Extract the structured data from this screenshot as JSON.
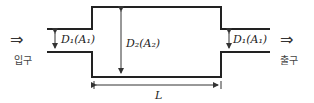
{
  "diagram": {
    "inlet_label": "입구",
    "outlet_label": "출구",
    "inlet_arrow": "⇒",
    "outlet_arrow": "⇒",
    "d1_left": "D₁(A₁)",
    "d2": "D₂(A₂)",
    "d1_right": "D₁(A₁)",
    "length": "L"
  }
}
